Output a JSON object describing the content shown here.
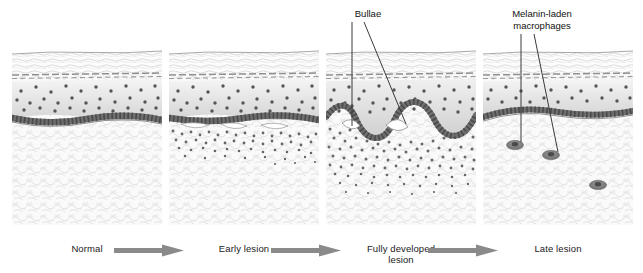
{
  "figure": {
    "panel_count": 4,
    "background_color": "#ffffff"
  },
  "stages": [
    {
      "id": "normal",
      "label": "Normal"
    },
    {
      "id": "early-lesion",
      "label": "Early lesion"
    },
    {
      "id": "fully-developed",
      "label": "Fully developed\nlesion"
    },
    {
      "id": "late-lesion",
      "label": "Late lesion"
    }
  ],
  "arrows": [
    {
      "id": "arrow-normal-to-early",
      "direction": "right"
    },
    {
      "id": "arrow-early-to-developed",
      "direction": "right"
    },
    {
      "id": "arrow-developed-to-late",
      "direction": "right"
    }
  ],
  "callouts": [
    {
      "id": "bullae",
      "label": "Bullae",
      "target_panel": "fully-developed",
      "leader_count": 2
    },
    {
      "id": "melanin-laden-macrophages",
      "label": "Melanin-laden\nmacrophages",
      "target_panel": "late-lesion",
      "leader_count": 2
    }
  ],
  "panels": [
    {
      "id": "panel-normal",
      "stage": "Normal",
      "layers": [
        "stratum corneum",
        "granular layer",
        "epidermis",
        "basal layer",
        "dermis"
      ],
      "basal_layer_intact": true,
      "bullae": 0,
      "dermal_infiltrate": "none",
      "macrophages": 0
    },
    {
      "id": "panel-early-lesion",
      "stage": "Early lesion",
      "layers": [
        "stratum corneum",
        "granular layer",
        "epidermis",
        "basal layer",
        "dermis"
      ],
      "basal_layer_intact": true,
      "bullae": 3,
      "dermal_infiltrate": "sparse band",
      "macrophages": 0
    },
    {
      "id": "panel-fully-developed",
      "stage": "Fully developed lesion",
      "layers": [
        "stratum corneum",
        "granular layer",
        "epidermis",
        "basal layer",
        "dermis"
      ],
      "basal_layer_intact": false,
      "bullae": 2,
      "dermal_infiltrate": "dense band",
      "macrophages": 0
    },
    {
      "id": "panel-late-lesion",
      "stage": "Late lesion",
      "layers": [
        "stratum corneum",
        "granular layer",
        "epidermis",
        "basal layer",
        "dermis"
      ],
      "basal_layer_intact": true,
      "bullae": 0,
      "dermal_infiltrate": "resolved",
      "macrophages": 3
    }
  ],
  "colors": {
    "arrow": "#8a8a8a",
    "text": "#1a1a1a",
    "leader_line": "#3a3a3a",
    "basal_cell": "#6e6e6e",
    "epidermal_cell": "#5c5c5c",
    "dermis": "#f4f4f4",
    "epidermis_top": "#f2f2f2",
    "epidermis_bottom": "#d6d6d6",
    "stratum_corneum": "#fbfbfb",
    "macrophage": "#8c8c8c",
    "infiltrate_cell": "#6b6b6b"
  }
}
